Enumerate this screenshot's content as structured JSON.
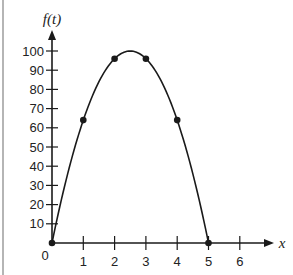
{
  "chart_data": {
    "type": "line",
    "title": "",
    "xlabel": "x",
    "ylabel": "f(t)",
    "x": [
      0,
      1,
      2,
      3,
      4,
      5
    ],
    "series": [
      {
        "name": "f(t)",
        "values": [
          0,
          64,
          96,
          96,
          64,
          0
        ],
        "curve": "parabola",
        "peak": {
          "x": 2.5,
          "y": 100
        }
      }
    ],
    "marked_points": [
      [
        0,
        0
      ],
      [
        1,
        64
      ],
      [
        2,
        96
      ],
      [
        3,
        96
      ],
      [
        4,
        64
      ],
      [
        5,
        0
      ]
    ],
    "xticks": [
      "1",
      "2",
      "3",
      "4",
      "5",
      "6"
    ],
    "yticks": [
      "10",
      "20",
      "30",
      "40",
      "50",
      "60",
      "70",
      "80",
      "90",
      "100"
    ],
    "origin_label": "0",
    "xlim": [
      0,
      7
    ],
    "ylim": [
      0,
      110
    ],
    "grid": false,
    "legend": "none"
  },
  "colors": {
    "line": "#1a1a1a",
    "axis": "#1a1a1a",
    "border": "#b5b5b5"
  }
}
